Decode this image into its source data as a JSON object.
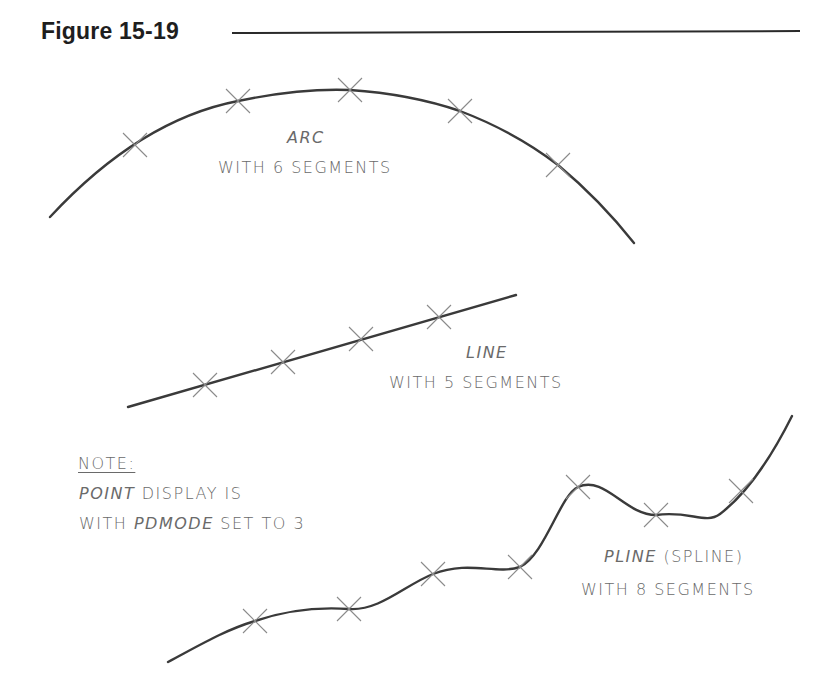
{
  "figure": {
    "title": "Figure 15-19",
    "rule_color": "#2a2a2a"
  },
  "colors": {
    "curve": "#3a3a3a",
    "marker": "#8a8a8a",
    "text": "#6a6a6a"
  },
  "arc": {
    "type_label": "ARC",
    "caption": "WITH 6 SEGMENTS",
    "segments": 6,
    "marker_symbol": "X"
  },
  "line": {
    "type_label": "LINE",
    "caption": "WITH 5 SEGMENTS",
    "segments": 5,
    "marker_symbol": "X"
  },
  "pline": {
    "type_label": "PLINE",
    "type_suffix": "(SPLINE)",
    "caption": "WITH 8 SEGMENTS",
    "segments": 8,
    "marker_symbol": "X"
  },
  "note": {
    "heading": "NOTE:",
    "line1_italic": "POINT",
    "line1_rest": "DISPLAY IS",
    "line2_prefix": "WITH",
    "line2_italic": "PDMODE",
    "line2_rest": "SET TO 3"
  }
}
